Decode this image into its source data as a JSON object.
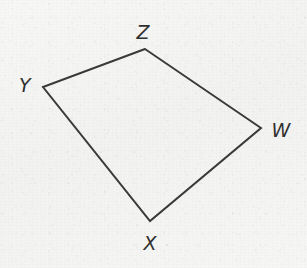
{
  "figure": {
    "shape_name": "quadrilateral",
    "background_color": "#f5f5f3",
    "stroke_color": "#3a3a3a",
    "stroke_width": 2,
    "label_color": "#2f2f2f",
    "canvas": {
      "width": 307,
      "height": 268
    },
    "vertices": [
      {
        "id": "Z",
        "label": "Z",
        "x": 145,
        "y": 49,
        "label_x": 143,
        "label_y": 32
      },
      {
        "id": "Y",
        "label": "Y",
        "x": 43,
        "y": 87,
        "label_x": 25,
        "label_y": 85
      },
      {
        "id": "X",
        "label": "X",
        "x": 150,
        "y": 221,
        "label_x": 150,
        "label_y": 243
      },
      {
        "id": "W",
        "label": "W",
        "x": 261,
        "y": 128,
        "label_x": 281,
        "label_y": 130
      }
    ],
    "edges": [
      {
        "id": "edge-zy",
        "from": "Z",
        "to": "Y"
      },
      {
        "id": "edge-yx",
        "from": "Y",
        "to": "X"
      },
      {
        "id": "edge-xw",
        "from": "X",
        "to": "W"
      },
      {
        "id": "edge-wz",
        "from": "W",
        "to": "Z"
      }
    ],
    "path_points": "145,49 43,87 150,221 261,128"
  }
}
